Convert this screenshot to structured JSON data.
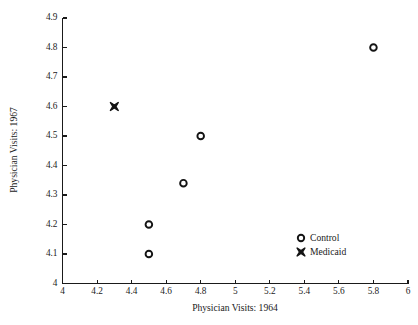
{
  "chart_data": {
    "type": "scatter",
    "title": "",
    "xlabel": "Physician Visits: 1964",
    "ylabel": "Physician Visits: 1967",
    "xlim": [
      4,
      6
    ],
    "ylim": [
      4,
      4.9
    ],
    "grid": false,
    "legend_position": "lower-right-inside",
    "xticks": [
      "4",
      "4.2",
      "4.4",
      "4.6",
      "4.8",
      "5",
      "5.2",
      "5.4",
      "5.6",
      "5.8",
      "6"
    ],
    "xtick_values": [
      4,
      4.2,
      4.4,
      4.6,
      4.8,
      5,
      5.2,
      5.4,
      5.6,
      5.8,
      6
    ],
    "yticks": [
      "4",
      "4.1",
      "4.2",
      "4.3",
      "4.4",
      "4.5",
      "4.6",
      "4.7",
      "4.8",
      "4.9"
    ],
    "ytick_values": [
      4,
      4.1,
      4.2,
      4.3,
      4.4,
      4.5,
      4.6,
      4.7,
      4.8,
      4.9
    ],
    "series": [
      {
        "name": "Control",
        "marker": "open-circle",
        "color": "#141414",
        "points": [
          {
            "x": 4.5,
            "y": 4.1
          },
          {
            "x": 4.5,
            "y": 4.2
          },
          {
            "x": 4.7,
            "y": 4.34
          },
          {
            "x": 4.8,
            "y": 4.5
          },
          {
            "x": 5.8,
            "y": 4.8
          }
        ]
      },
      {
        "name": "Medicaid",
        "marker": "filled-x",
        "color": "#141414",
        "points": [
          {
            "x": 4.3,
            "y": 4.6
          }
        ]
      }
    ]
  },
  "legend": {
    "items": [
      {
        "label": "Control",
        "marker": "open-circle"
      },
      {
        "label": "Medicaid",
        "marker": "filled-x"
      }
    ]
  },
  "axes": {
    "x_title": "Physician Visits: 1964",
    "y_title": "Physician Visits: 1967"
  }
}
